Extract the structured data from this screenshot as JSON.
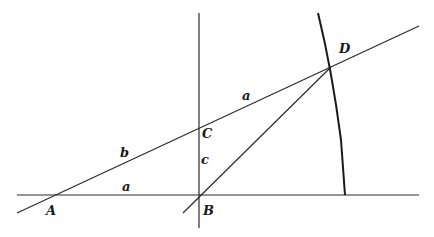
{
  "diagram": {
    "type": "geometric-construction",
    "points": [
      {
        "id": "A",
        "label": "A",
        "x": 53,
        "y": 195,
        "lx": 46,
        "ly": 215
      },
      {
        "id": "B",
        "label": "B",
        "x": 199,
        "y": 195,
        "lx": 203,
        "ly": 215
      },
      {
        "id": "C",
        "label": "C",
        "x": 199,
        "y": 128,
        "lx": 202,
        "ly": 138
      },
      {
        "id": "D",
        "label": "D",
        "x": 331,
        "y": 67,
        "lx": 339,
        "ly": 53
      }
    ],
    "segment_labels": [
      {
        "id": "AB",
        "label": "a",
        "x": 122,
        "y": 191
      },
      {
        "id": "AC",
        "label": "b",
        "x": 120,
        "y": 157
      },
      {
        "id": "BC",
        "label": "c",
        "x": 201,
        "y": 164
      },
      {
        "id": "CD",
        "label": "a",
        "x": 242,
        "y": 100
      }
    ],
    "lines": [
      {
        "id": "baseline",
        "x1": 17,
        "y1": 195,
        "x2": 419,
        "y2": 195
      },
      {
        "id": "vertical",
        "x1": 199,
        "y1": 13,
        "x2": 199,
        "y2": 228
      },
      {
        "id": "line-AD",
        "x1": 17,
        "y1": 213,
        "x2": 419,
        "y2": 26
      },
      {
        "id": "line-BD",
        "x1": 183,
        "y1": 213,
        "x2": 331,
        "y2": 67
      }
    ],
    "arc": {
      "id": "arc-D",
      "path": "M318,13 Q332,70 341,140 L345,195"
    },
    "colors": {
      "stroke": "#2a2a2a",
      "background": "#ffffff"
    }
  }
}
